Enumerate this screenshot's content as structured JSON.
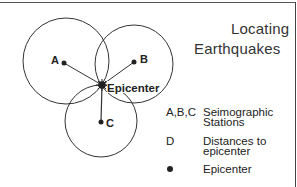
{
  "title": {
    "line1": "Locating",
    "line2": "Earthquakes"
  },
  "diagram": {
    "stations": [
      {
        "label": "A",
        "cx": 64,
        "cy": 63,
        "r": 43
      },
      {
        "label": "B",
        "cx": 134,
        "cy": 62,
        "r": 39
      },
      {
        "label": "C",
        "cx": 101,
        "cy": 122,
        "r": 37
      }
    ],
    "epicenter": {
      "label": "Epicenter",
      "x": 102,
      "y": 85
    }
  },
  "legend": {
    "items": [
      {
        "key": "A,B,C",
        "desc_line1": "Seimographic",
        "desc_line2": "Stations"
      },
      {
        "key": "D",
        "desc_line1": "Distances to",
        "desc_line2": "epicenter"
      },
      {
        "key": "●",
        "desc_line1": "Epicenter",
        "desc_line2": ""
      }
    ]
  },
  "colors": {
    "line": "#333333",
    "text": "#222222",
    "background": "#ffffff"
  }
}
